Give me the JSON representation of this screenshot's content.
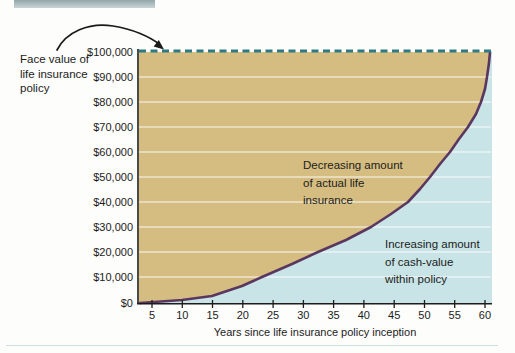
{
  "header_bar": {
    "color": "#a9bbbe"
  },
  "chart_data": {
    "type": "area",
    "title": "",
    "xlabel": "Years since life insurance policy inception",
    "ylabel": "",
    "x_ticks": [
      5,
      10,
      15,
      20,
      25,
      30,
      35,
      40,
      45,
      50,
      55,
      60
    ],
    "y_tick_labels": [
      "$100,000",
      "$90,000",
      "$80,000",
      "$70,000",
      "$60,000",
      "$50,000",
      "$40,000",
      "$30,000",
      "$20,000",
      "$10,000",
      "$0"
    ],
    "xlim": [
      3,
      61
    ],
    "ylim": [
      0,
      100000
    ],
    "grid": "horizontal white gridlines every $10,000",
    "legend_position": "labels inside plot areas",
    "face_value_line": {
      "value": 100000,
      "style": "dashed",
      "color": "#2e7a82"
    },
    "series": [
      {
        "name": "Decreasing amount of actual life insurance",
        "region": "area above cash-value curve, below $100,000 face-value line",
        "fill": "#d5bc81"
      },
      {
        "name": "Increasing amount of cash-value within policy",
        "region": "area below cash-value curve",
        "fill": "#c9e4e6"
      }
    ],
    "cash_value_curve": {
      "color": "#5a3760",
      "points": [
        {
          "year": 3,
          "value": 0
        },
        {
          "year": 10,
          "value": 1200
        },
        {
          "year": 15,
          "value": 3000
        },
        {
          "year": 20,
          "value": 5500
        },
        {
          "year": 25,
          "value": 11000
        },
        {
          "year": 30,
          "value": 17000
        },
        {
          "year": 35,
          "value": 23000
        },
        {
          "year": 40,
          "value": 28500
        },
        {
          "year": 45,
          "value": 36000
        },
        {
          "year": 50,
          "value": 47000
        },
        {
          "year": 55,
          "value": 62000
        },
        {
          "year": 58,
          "value": 74000
        },
        {
          "year": 60,
          "value": 88000
        },
        {
          "year": 61,
          "value": 100000
        }
      ]
    }
  },
  "annotations": {
    "face_value_label": {
      "lines": [
        "Face value of",
        "life insurance",
        "policy"
      ]
    },
    "decreasing_label": {
      "lines": [
        "Decreasing amount",
        "of actual life",
        "insurance"
      ]
    },
    "increasing_label": {
      "lines": [
        "Increasing amount",
        "of cash-value",
        "within policy"
      ]
    }
  },
  "colors": {
    "insurance_area": "#d5bc81",
    "cash_value_area": "#c9e4e6",
    "curve": "#5a3760",
    "dashed_face_value_line": "#2e7a82",
    "axis": "#1d1d1d",
    "gridline": "#ffffff"
  }
}
